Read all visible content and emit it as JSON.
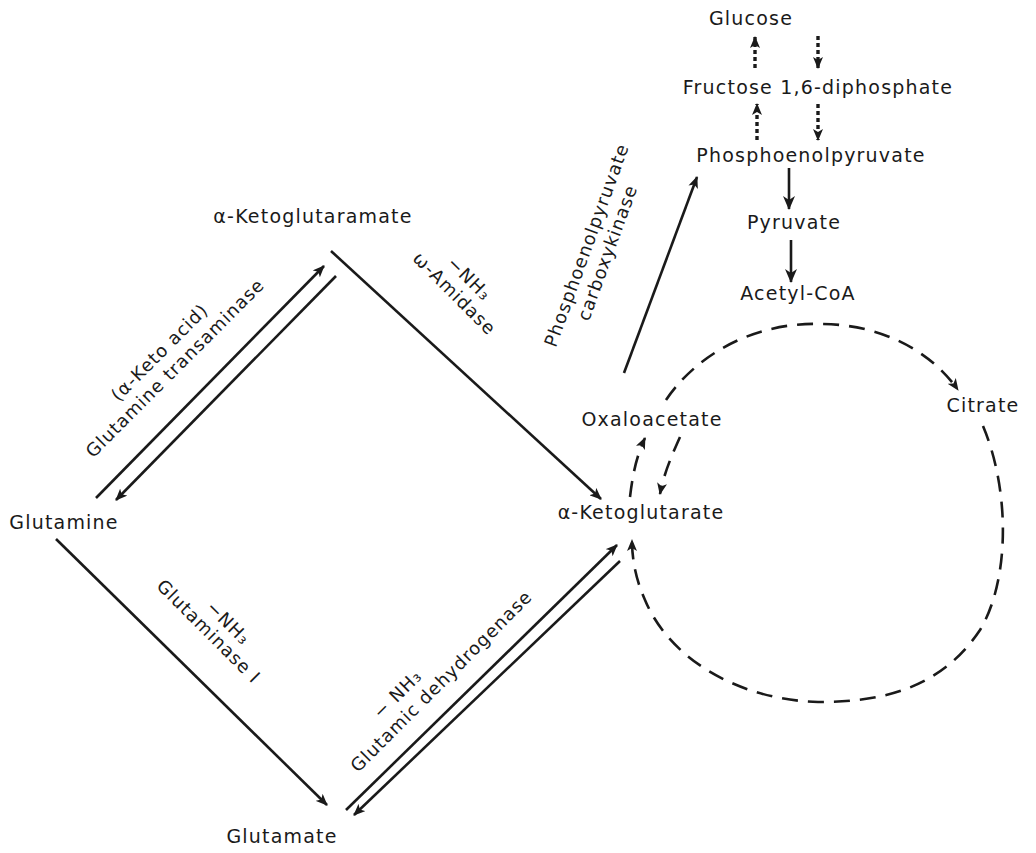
{
  "diagram": {
    "type": "metabolic-pathway",
    "nodes": {
      "glucose": "Glucose",
      "fructose": "Fructose 1,6-diphosphate",
      "pep": "Phosphoenolpyruvate",
      "pyruvate": "Pyruvate",
      "acetyl_coa": "Acetyl-CoA",
      "ketoglutaramate": "α-Ketoglutaramate",
      "glutamine": "Glutamine",
      "glutamate": "Glutamate",
      "ketoglutarate": "α-Ketoglutarate",
      "oxaloacetate": "Oxaloacetate",
      "citrate": "Citrate"
    },
    "enzymes": {
      "pepck_line1": "Phosphoenolpyruvate",
      "pepck_line2": "carboxykinase",
      "transaminase_cofactor": "(α-Keto acid)",
      "transaminase": "Glutamine transaminase",
      "amidase_nh3": "−NH₃",
      "amidase": "ω-Amidase",
      "glutaminase_nh3": "−NH₃",
      "glutaminase": "Glutaminase I",
      "gdh_nh3": "− NH₃",
      "gdh": "Glutamic dehydrogenase"
    },
    "edges": [
      {
        "from": "Glucose",
        "to": "Fructose 1,6-diphosphate",
        "style": "dotted"
      },
      {
        "from": "Fructose 1,6-diphosphate",
        "to": "Glucose",
        "style": "dotted"
      },
      {
        "from": "Fructose 1,6-diphosphate",
        "to": "Phosphoenolpyruvate",
        "style": "dotted"
      },
      {
        "from": "Phosphoenolpyruvate",
        "to": "Fructose 1,6-diphosphate",
        "style": "dotted"
      },
      {
        "from": "Phosphoenolpyruvate",
        "to": "Pyruvate",
        "style": "solid"
      },
      {
        "from": "Pyruvate",
        "to": "Acetyl-CoA",
        "style": "solid"
      },
      {
        "from": "Oxaloacetate",
        "to": "Phosphoenolpyruvate",
        "style": "solid",
        "enzyme": "Phosphoenolpyruvate carboxykinase"
      },
      {
        "from": "Glutamine",
        "to": "α-Ketoglutaramate",
        "style": "solid",
        "enzyme": "Glutamine transaminase"
      },
      {
        "from": "α-Ketoglutaramate",
        "to": "Glutamine",
        "style": "solid"
      },
      {
        "from": "α-Ketoglutaramate",
        "to": "α-Ketoglutarate",
        "style": "solid",
        "enzyme": "ω-Amidase"
      },
      {
        "from": "Glutamine",
        "to": "Glutamate",
        "style": "solid",
        "enzyme": "Glutaminase I"
      },
      {
        "from": "Glutamate",
        "to": "α-Ketoglutarate",
        "style": "solid",
        "enzyme": "Glutamic dehydrogenase"
      },
      {
        "from": "α-Ketoglutarate",
        "to": "Glutamate",
        "style": "solid"
      },
      {
        "from": "α-Ketoglutarate",
        "to": "Oxaloacetate",
        "style": "dashed"
      },
      {
        "from": "Oxaloacetate",
        "to": "α-Ketoglutarate",
        "style": "dashed"
      },
      {
        "from": "Oxaloacetate",
        "to": "Citrate",
        "style": "dashed"
      },
      {
        "from": "Citrate",
        "to": "α-Ketoglutarate",
        "style": "dashed"
      }
    ]
  }
}
